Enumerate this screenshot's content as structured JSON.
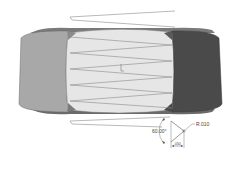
{
  "drawing": {
    "subject": "Hex nut with internal thread (side view)",
    "colors": {
      "background": "#ffffff",
      "left_face": "#a8a8a8",
      "center_face": "#e6e6e6",
      "right_face": "#4a4a4a",
      "outline": "#5a5a5a",
      "thread_line": "#8a8a8a",
      "dimension_line": "#555555"
    },
    "annotations": {
      "radius_label": "R.010",
      "angle_label": "60.00°",
      "width_label": ".050"
    }
  }
}
